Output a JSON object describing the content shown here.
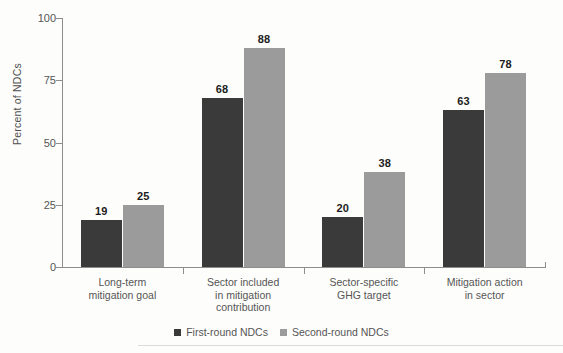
{
  "chart_data": {
    "type": "bar",
    "title": "",
    "xlabel": "",
    "ylabel": "Percent of NDCs",
    "ylim": [
      0,
      100
    ],
    "yticks": [
      0,
      25,
      50,
      75,
      100
    ],
    "grid": false,
    "legend_position": "bottom",
    "categories": [
      "Long-term mitigation goal",
      "Sector included in mitigation contribution",
      "Sector-specific GHG target",
      "Mitigation action in sector"
    ],
    "category_lines": [
      [
        "Long-term",
        "mitigation goal"
      ],
      [
        "Sector included",
        "in mitigation",
        "contribution"
      ],
      [
        "Sector-specific",
        "GHG target"
      ],
      [
        "Mitigation action",
        "in sector"
      ]
    ],
    "series": [
      {
        "name": "First-round NDCs",
        "color": "#3a3a3a",
        "values": [
          19,
          68,
          20,
          63
        ]
      },
      {
        "name": "Second-round NDCs",
        "color": "#9b9b9b",
        "values": [
          25,
          88,
          38,
          78
        ]
      }
    ]
  },
  "axis": {
    "y_title": "Percent of NDCs",
    "y_tick_labels": [
      "0",
      "25",
      "50",
      "75",
      "100"
    ]
  },
  "legend": {
    "items": [
      {
        "label": "First-round NDCs"
      },
      {
        "label": "Second-round NDCs"
      }
    ]
  }
}
